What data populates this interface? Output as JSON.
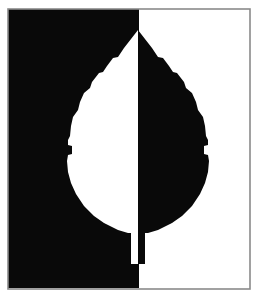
{
  "artwork": {
    "title": "Leaf Figure-Ground Reversal",
    "type": "black-and-white-silhouette",
    "technique": "positive-negative-space-inversion",
    "canvas": {
      "width": 260,
      "height": 307,
      "background_color": "#ffffff"
    },
    "frame": {
      "left": 8,
      "top": 9,
      "right": 250,
      "bottom": 289,
      "border_color": "#8a8a8a",
      "border_thickness": 1.6
    },
    "panels": [
      {
        "name": "left-panel",
        "fill_color": "#090909",
        "x": 8,
        "y": 9,
        "width": 131,
        "height": 279,
        "figure_color": "#ffffff",
        "figure_role": "negative-space-leaf-half"
      },
      {
        "name": "right-panel",
        "fill_color": "#ffffff",
        "x": 139,
        "y": 9,
        "width": 111,
        "height": 279,
        "figure_color": "#090909",
        "figure_role": "positive-space-leaf-half"
      }
    ],
    "divider": {
      "name": "vertical-midline",
      "x": 139,
      "color": "#090909"
    },
    "leaf": {
      "tip_x": 138,
      "tip_y": 30,
      "widest_left_x": 67,
      "widest_right_x": 209,
      "widest_y": 170,
      "base_y": 232,
      "stem": {
        "top_y": 232,
        "bottom_y": 264,
        "left_x": 131,
        "right_x": 146,
        "width": 15
      },
      "left_outline": "M 138 30 L 124 48 L 118 57 L 113 58 L 107 66 L 103 72 L 99 73 L 92 82 L 90 88 L 84 93 L 80 102 L 78 110 L 73 117 L 71 126 L 70 136 L 68 140 L 68 145 L 72 146 L 72 154 L 68 155 L 67 161 L 68 172 L 71 183 L 76 194 L 84 206 L 94 216 L 104 223 L 118 230 L 128 233 L 131 233 L 131 264 L 138 264 Z",
      "right_outline": "M 138 30 L 152 48 L 158 57 L 163 58 L 169 66 L 173 72 L 177 73 L 184 82 L 186 88 L 192 93 L 196 102 L 198 110 L 203 117 L 205 126 L 206 136 L 208 140 L 208 145 L 204 146 L 204 154 L 208 155 L 209 161 L 208 172 L 205 183 L 200 194 L 192 206 L 182 216 L 172 223 L 158 230 L 148 233 L 145 233 L 145 264 L 138 264 Z"
    },
    "palette": {
      "black": "#090909",
      "white": "#ffffff",
      "frame_gray": "#8a8a8a"
    }
  }
}
